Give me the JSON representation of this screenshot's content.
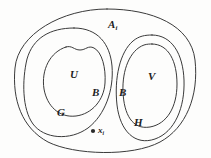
{
  "figure": {
    "kind": "set-theory-venn-diagram",
    "background_color": "#fdfdfc",
    "stroke_color": "#3a3a3a",
    "point_color": "#2b2b2b",
    "labels": {
      "outer_set": "A",
      "outer_set_subscript": "i",
      "left_inner_set": "U",
      "left_boundary": "B",
      "right_boundary": "B",
      "right_inner_set": "V",
      "left_outer_set": "G",
      "right_outer_set": "H",
      "point": "x",
      "point_subscript": "i"
    },
    "point_marker": {
      "name": "point-x-i",
      "cx": 93,
      "cy": 131,
      "r": 2.1
    },
    "curves": {
      "outer_ellipse": "M 107 9 C 152 9 191 25 195 60 C 199 96 186 128 160 142 C 132 157 74 155 48 142 C 22 128 12 100 15 68 C 18 34 62 9 107 9 Z",
      "left_outer_blob": "M 74 28 C 98 28 110 44 112 66 C 114 90 105 115 88 128 C 70 141 44 139 33 124 C 22 109 22 80 27 59 C 33 38 50 28 74 28 Z",
      "left_inner_blob": "M 66 47 C 72 45 74 50 80 50 C 86 50 88 45 94 48 C 102 52 106 68 105 83 C 104 100 92 114 76 116 C 59 118 47 106 44 89 C 41 70 50 52 66 47 Z",
      "right_outer_blob": "M 152 35 C 172 35 183 54 184 80 C 185 107 175 132 155 139 C 135 146 120 131 117 105 C 114 78 120 52 133 41 C 139 36 145 35 152 35 Z",
      "right_inner_blob": "M 152 44 C 169 44 177 62 177 84 C 177 107 167 124 150 127 C 132 130 124 114 123 92 C 122 70 130 50 144 45 C 147 44 150 44 152 44 Z"
    }
  }
}
